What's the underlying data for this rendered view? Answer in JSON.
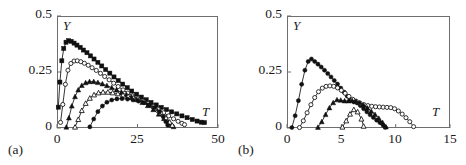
{
  "figure": {
    "panels": [
      {
        "id": "(a)",
        "x_axis": {
          "label": "T",
          "min": 0,
          "max": 50,
          "ticks": [
            "0",
            "25",
            "50"
          ],
          "tick_values": [
            0,
            25,
            50
          ]
        },
        "y_axis": {
          "label": "Y",
          "min": 0,
          "max": 0.5,
          "ticks": [
            "0",
            "0.25",
            "0.5"
          ],
          "tick_values": [
            0,
            0.25,
            0.5
          ]
        }
      },
      {
        "id": "(b)",
        "x_axis": {
          "label": "T",
          "min": 0,
          "max": 15,
          "ticks": [
            "0",
            "5",
            "10",
            "15"
          ],
          "tick_values": [
            0,
            5,
            10,
            15
          ]
        },
        "y_axis": {
          "label": "Y",
          "min": 0,
          "max": 0.5,
          "ticks": [
            "0",
            "0.25",
            "0.5"
          ],
          "tick_values": [
            0,
            0.25,
            0.5
          ]
        }
      }
    ]
  },
  "chart_data": [
    {
      "type": "line",
      "panel": "(a)",
      "title": "",
      "xlabel": "T",
      "ylabel": "Y",
      "xlim": [
        0,
        50
      ],
      "ylim": [
        0,
        0.5
      ],
      "grid": false,
      "legend": "none",
      "xticks": [
        0,
        25,
        50
      ],
      "yticks": [
        0,
        0.25,
        0.5
      ],
      "series": [
        {
          "name": "curve-1",
          "marker": "filled-square",
          "x": [
            0.4,
            0.9,
            1.5,
            2.1,
            2.8,
            3.6,
            4.4,
            5.3,
            6.2,
            7.2,
            8.2,
            9.3,
            10.4,
            11.5,
            12.7,
            13.9,
            15.1,
            16.4,
            17.7,
            19.0,
            20.4,
            21.8,
            23.2,
            24.7,
            26.2,
            27.7,
            29.2,
            30.8,
            32.4,
            34.0,
            35.6,
            37.2,
            38.8,
            40.4,
            42.0,
            43.5,
            44.8,
            45.8
          ],
          "y": [
            0.093,
            0.205,
            0.3,
            0.355,
            0.383,
            0.39,
            0.387,
            0.379,
            0.37,
            0.36,
            0.348,
            0.336,
            0.322,
            0.308,
            0.293,
            0.277,
            0.261,
            0.245,
            0.228,
            0.212,
            0.196,
            0.18,
            0.165,
            0.151,
            0.138,
            0.126,
            0.114,
            0.103,
            0.092,
            0.082,
            0.072,
            0.063,
            0.054,
            0.046,
            0.038,
            0.031,
            0.026,
            0.024
          ]
        },
        {
          "name": "curve-2",
          "marker": "open-circle",
          "x": [
            1.1,
            1.8,
            2.6,
            3.4,
            4.3,
            5.3,
            6.3,
            7.4,
            8.5,
            9.7,
            10.9,
            12.2,
            13.5,
            14.8,
            16.2,
            17.6,
            19.0,
            20.5,
            22.0,
            23.5,
            25.1,
            26.7,
            28.3,
            29.9,
            31.5,
            33.1,
            34.7,
            36.2,
            37.6,
            38.8,
            39.6
          ],
          "y": [
            0.025,
            0.105,
            0.195,
            0.258,
            0.288,
            0.299,
            0.3,
            0.296,
            0.289,
            0.28,
            0.269,
            0.257,
            0.244,
            0.23,
            0.215,
            0.2,
            0.185,
            0.17,
            0.156,
            0.143,
            0.131,
            0.12,
            0.109,
            0.096,
            0.082,
            0.068,
            0.054,
            0.041,
            0.03,
            0.021,
            0.015
          ]
        },
        {
          "name": "curve-3",
          "marker": "filled-triangle",
          "x": [
            2.9,
            3.7,
            4.6,
            5.6,
            6.6,
            7.7,
            8.9,
            10.1,
            11.4,
            12.7,
            14.1,
            15.5,
            17.0,
            18.5,
            20.0,
            21.6,
            23.2,
            24.8,
            26.5,
            28.2,
            29.9,
            31.6,
            33.2,
            34.6,
            35.6,
            36.2
          ],
          "y": [
            0.004,
            0.045,
            0.098,
            0.14,
            0.17,
            0.19,
            0.202,
            0.207,
            0.207,
            0.203,
            0.197,
            0.189,
            0.18,
            0.17,
            0.159,
            0.148,
            0.137,
            0.126,
            0.114,
            0.1,
            0.082,
            0.062,
            0.042,
            0.024,
            0.012,
            0.006
          ]
        },
        {
          "name": "curve-4",
          "marker": "open-triangle",
          "x": [
            5.6,
            6.6,
            7.7,
            8.9,
            10.2,
            11.5,
            12.9,
            14.3,
            15.8,
            17.3,
            18.9,
            20.5,
            22.1,
            23.8,
            25.5,
            27.2,
            28.9,
            30.6,
            32.3,
            33.8,
            35.0,
            35.8
          ],
          "y": [
            0.004,
            0.038,
            0.078,
            0.11,
            0.133,
            0.148,
            0.157,
            0.16,
            0.16,
            0.157,
            0.153,
            0.147,
            0.141,
            0.134,
            0.126,
            0.117,
            0.105,
            0.089,
            0.068,
            0.046,
            0.026,
            0.012
          ]
        },
        {
          "name": "curve-5",
          "marker": "filled-circle",
          "x": [
            10.2,
            11.4,
            12.7,
            14.1,
            15.5,
            17.0,
            18.6,
            20.2,
            21.9,
            23.6,
            25.3,
            27.0,
            28.7,
            30.3,
            31.8,
            33.0,
            33.8,
            34.4
          ],
          "y": [
            0.005,
            0.04,
            0.073,
            0.098,
            0.115,
            0.125,
            0.13,
            0.131,
            0.129,
            0.125,
            0.12,
            0.113,
            0.104,
            0.091,
            0.073,
            0.05,
            0.028,
            0.012
          ]
        }
      ]
    },
    {
      "type": "line",
      "panel": "(b)",
      "title": "",
      "xlabel": "T",
      "ylabel": "Y",
      "xlim": [
        0,
        15
      ],
      "ylim": [
        0,
        0.5
      ],
      "grid": false,
      "legend": "none",
      "xticks": [
        0,
        5,
        10,
        15
      ],
      "yticks": [
        0,
        0.25,
        0.5
      ],
      "series": [
        {
          "name": "curve-1",
          "marker": "filled-circle",
          "x": [
            0.45,
            0.75,
            1.05,
            1.35,
            1.65,
            1.95,
            2.25,
            2.55,
            2.85,
            3.15,
            3.45,
            3.75,
            4.05,
            4.35,
            4.65,
            4.95,
            5.25,
            5.55,
            5.85,
            6.15,
            6.45,
            6.75,
            7.05,
            7.35,
            7.65,
            7.95,
            8.25,
            8.55,
            8.85,
            9.05
          ],
          "y": [
            0.002,
            0.055,
            0.122,
            0.195,
            0.258,
            0.297,
            0.308,
            0.297,
            0.285,
            0.272,
            0.258,
            0.243,
            0.228,
            0.212,
            0.196,
            0.178,
            0.16,
            0.142,
            0.125,
            0.116,
            0.112,
            0.1,
            0.086,
            0.072,
            0.059,
            0.047,
            0.035,
            0.024,
            0.012,
            0.003
          ]
        },
        {
          "name": "curve-2",
          "marker": "open-circle",
          "x": [
            1.15,
            1.5,
            1.85,
            2.2,
            2.55,
            2.9,
            3.25,
            3.6,
            3.95,
            4.3,
            4.65,
            5.0,
            5.35,
            5.7,
            6.05,
            6.4,
            6.75,
            7.1,
            7.45,
            7.8,
            8.15,
            8.5,
            8.85,
            9.2,
            9.55,
            9.9,
            10.25,
            10.6,
            10.95,
            11.3,
            11.65
          ],
          "y": [
            0.002,
            0.032,
            0.068,
            0.104,
            0.136,
            0.162,
            0.178,
            0.186,
            0.188,
            0.186,
            0.179,
            0.168,
            0.155,
            0.141,
            0.128,
            0.118,
            0.11,
            0.104,
            0.1,
            0.097,
            0.095,
            0.094,
            0.093,
            0.092,
            0.091,
            0.086,
            0.076,
            0.062,
            0.046,
            0.028,
            0.006
          ]
        },
        {
          "name": "curve-3",
          "marker": "filled-triangle",
          "x": [
            2.85,
            3.2,
            3.55,
            3.9,
            4.25,
            4.6,
            4.95,
            5.3,
            5.65,
            6.0,
            6.35,
            6.7,
            7.05,
            7.4,
            7.75,
            8.1,
            8.45,
            8.8,
            9.1
          ],
          "y": [
            0.003,
            0.028,
            0.06,
            0.09,
            0.113,
            0.126,
            0.124,
            0.121,
            0.121,
            0.122,
            0.12,
            0.113,
            0.102,
            0.089,
            0.075,
            0.06,
            0.043,
            0.024,
            0.005
          ]
        },
        {
          "name": "curve-4",
          "marker": "open-triangle",
          "x": [
            5.1,
            5.45,
            5.8,
            6.15,
            6.5,
            6.85,
            7.05
          ],
          "y": [
            0.004,
            0.032,
            0.062,
            0.082,
            0.072,
            0.04,
            0.008
          ]
        }
      ]
    }
  ]
}
